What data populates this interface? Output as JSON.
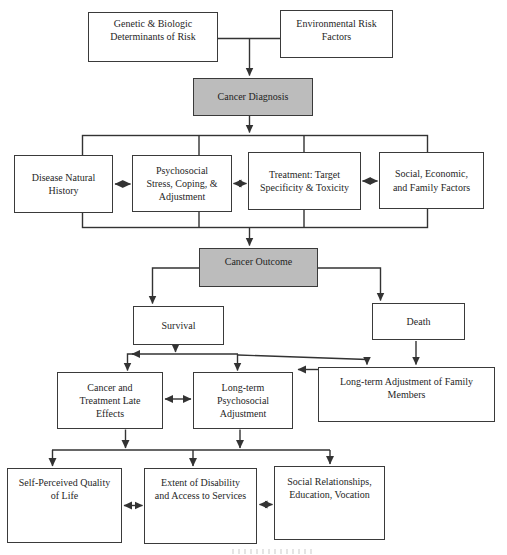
{
  "diagram": {
    "nodes": {
      "genetic": {
        "label": "Genetic & Biologic\nDeterminants of Risk"
      },
      "environmental": {
        "label": "Environmental Risk\nFactors"
      },
      "cancer_diagnosis": {
        "label": "Cancer Diagnosis"
      },
      "disease_history": {
        "label": "Disease Natural\nHistory"
      },
      "psychosocial_stress": {
        "label": "Psychosocial\nStress, Coping, &\nAdjustment"
      },
      "treatment": {
        "label": "Treatment: Target\nSpecificity & Toxicity"
      },
      "social_economic": {
        "label": "Social, Economic,\nand Family Factors"
      },
      "cancer_outcome": {
        "label": "Cancer Outcome"
      },
      "survival": {
        "label": "Survival"
      },
      "death": {
        "label": "Death"
      },
      "late_effects": {
        "label": "Cancer and\nTreatment Late\nEffects"
      },
      "longterm_adjustment": {
        "label": "Long-term\nPsychosocial\nAdjustment"
      },
      "family_adjustment": {
        "label": "Long-term Adjustment of Family\nMembers"
      },
      "quality_of_life": {
        "label": "Self-Perceived Quality\nof Life"
      },
      "disability": {
        "label": "Extent of Disability\nand Access to Services"
      },
      "social_relationships": {
        "label": "Social Relationships,\nEducation, Vocation"
      }
    },
    "colors": {
      "shaded_node_fill": "#bcbcbc",
      "node_border": "#3a3a3a",
      "connector_line": "#333333",
      "text": "#1f1f1f",
      "background": "#ffffff"
    }
  }
}
